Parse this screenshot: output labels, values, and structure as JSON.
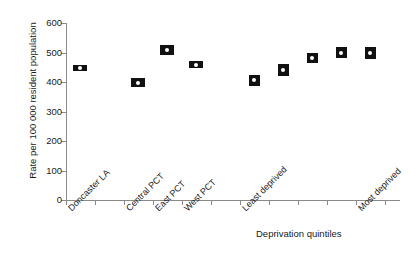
{
  "chart_data": {
    "type": "scatter",
    "title": "",
    "xlabel": "Deprivation quintiles",
    "ylabel": "Rate per 100 000 resident population",
    "ylim": [
      0,
      600
    ],
    "ytick_labels": [
      "0",
      "100",
      "200",
      "300",
      "400",
      "500",
      "600"
    ],
    "ytick_values": [
      0,
      100,
      200,
      300,
      400,
      500,
      600
    ],
    "grid": false,
    "legend": "none",
    "marker_style": "black confidence-interval box with white centre dot",
    "categories": [
      "Doncaster LA",
      "Central PCT",
      "East PCT",
      "West PCT",
      "Least deprived",
      "",
      "",
      "",
      "Most deprived"
    ],
    "values": [
      448,
      397,
      508,
      458,
      406,
      440,
      481,
      500,
      498
    ],
    "ci_low": [
      440,
      383,
      492,
      447,
      388,
      421,
      463,
      482,
      479
    ],
    "ci_high": [
      456,
      412,
      524,
      470,
      425,
      460,
      500,
      519,
      517
    ],
    "points": [
      {
        "label": "Doncaster LA",
        "value": 448,
        "ci_low": 440,
        "ci_high": 456,
        "x_px": 80,
        "group": "area"
      },
      {
        "label": "Central PCT",
        "value": 397,
        "ci_low": 383,
        "ci_high": 412,
        "x_px": 138,
        "group": "area"
      },
      {
        "label": "East PCT",
        "value": 508,
        "ci_low": 492,
        "ci_high": 524,
        "x_px": 167,
        "group": "area"
      },
      {
        "label": "West PCT",
        "value": 458,
        "ci_low": 447,
        "ci_high": 470,
        "x_px": 196,
        "group": "area"
      },
      {
        "label": "Least deprived",
        "value": 406,
        "ci_low": 388,
        "ci_high": 425,
        "x_px": 254,
        "group": "quintile"
      },
      {
        "label": "",
        "value": 440,
        "ci_low": 421,
        "ci_high": 460,
        "x_px": 283,
        "group": "quintile"
      },
      {
        "label": "",
        "value": 481,
        "ci_low": 463,
        "ci_high": 500,
        "x_px": 312,
        "group": "quintile"
      },
      {
        "label": "",
        "value": 500,
        "ci_low": 482,
        "ci_high": 519,
        "x_px": 341,
        "group": "quintile"
      },
      {
        "label": "Most deprived",
        "value": 498,
        "ci_low": 479,
        "ci_high": 517,
        "x_px": 370,
        "group": "quintile"
      }
    ],
    "xtick_px": [
      66,
      95,
      124,
      153,
      182,
      211,
      240,
      269,
      298,
      327,
      356,
      385
    ],
    "rotated_xlabels": [
      {
        "text": "Doncaster LA",
        "x_px": 66,
        "y_px": 206
      },
      {
        "text": "Central PCT",
        "x_px": 124,
        "y_px": 206
      },
      {
        "text": "East PCT",
        "x_px": 153,
        "y_px": 206
      },
      {
        "text": "West PCT",
        "x_px": 182,
        "y_px": 206
      },
      {
        "text": "Least deprived",
        "x_px": 240,
        "y_px": 206
      },
      {
        "text": "Most deprived",
        "x_px": 356,
        "y_px": 206
      }
    ],
    "axis_colors": {
      "axis_line": "#8a8a8a",
      "marker": "#111111",
      "dot": "#ffffff",
      "text": "#1a1a1a",
      "background": "#ffffff"
    }
  }
}
